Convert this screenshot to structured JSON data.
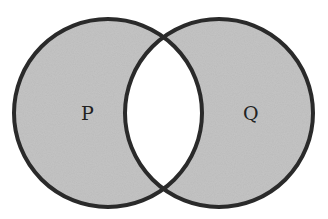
{
  "diagram": {
    "type": "venn",
    "sets": [
      {
        "id": "P",
        "label": "P",
        "cx": 108,
        "cy": 113,
        "r": 95
      },
      {
        "id": "Q",
        "label": "Q",
        "cx": 219,
        "cy": 113,
        "r": 95
      }
    ],
    "shaded_regions": [
      "P only",
      "Q only"
    ],
    "unshaded_regions": [
      "P ∩ Q"
    ],
    "colors": {
      "fill": "#c4c4c4",
      "stroke": "#2a2a2a",
      "intersection": "#ffffff",
      "background": "#ffffff"
    }
  }
}
